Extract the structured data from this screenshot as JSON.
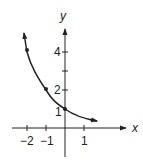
{
  "figure": {
    "function": "y = (1/2)^x",
    "axes": {
      "x_label": "x",
      "y_label": "y",
      "x_ticks": [
        {
          "value": -2,
          "label": "−2"
        },
        {
          "value": -1,
          "label": "−1"
        },
        {
          "value": 0,
          "label": ""
        },
        {
          "value": 1,
          "label": "1"
        }
      ],
      "y_ticks": [
        {
          "value": 1,
          "label": "1"
        },
        {
          "value": 2,
          "label": "2"
        },
        {
          "value": 3,
          "label": ""
        },
        {
          "value": 4,
          "label": "4"
        }
      ]
    },
    "points": [
      {
        "x": -2,
        "y": 4
      },
      {
        "x": -1,
        "y": 2
      },
      {
        "x": 0,
        "y": 1
      }
    ],
    "colors": {
      "ink": "#222222",
      "background": "#ffffff"
    }
  }
}
